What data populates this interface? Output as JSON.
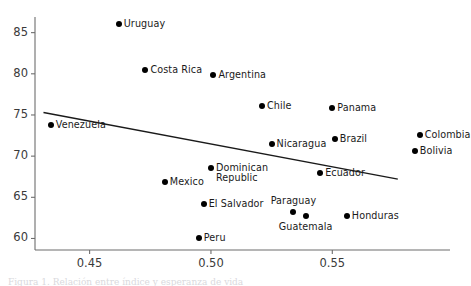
{
  "chart_data": {
    "type": "scatter",
    "title": "",
    "xlabel": "",
    "ylabel": "",
    "xlim": [
      0.4275,
      0.5985
    ],
    "ylim": [
      58.6,
      86.9
    ],
    "grid": false,
    "legend": false,
    "xticks": [
      0.45,
      0.5,
      0.55
    ],
    "xtick_labels": [
      "0.45",
      "0.50",
      "0.55"
    ],
    "yticks": [
      60,
      65,
      70,
      75,
      80,
      85
    ],
    "ytick_labels": [
      "60",
      "65",
      "70",
      "75",
      "80",
      "85"
    ],
    "points": [
      {
        "label": "Uruguay",
        "x": 0.462,
        "y": 86.0,
        "label_pos": "right"
      },
      {
        "label": "Costa Rica",
        "x": 0.473,
        "y": 80.5,
        "label_pos": "right"
      },
      {
        "label": "Argentina",
        "x": 0.501,
        "y": 79.8,
        "label_pos": "right"
      },
      {
        "label": "Chile",
        "x": 0.521,
        "y": 76.1,
        "label_pos": "right"
      },
      {
        "label": "Panama",
        "x": 0.55,
        "y": 75.9,
        "label_pos": "right"
      },
      {
        "label": "Venezuela",
        "x": 0.434,
        "y": 73.8,
        "label_pos": "right"
      },
      {
        "label": "Colombia",
        "x": 0.586,
        "y": 72.6,
        "label_pos": "right"
      },
      {
        "label": "Brazil",
        "x": 0.551,
        "y": 72.1,
        "label_pos": "right"
      },
      {
        "label": "Nicaragua",
        "x": 0.525,
        "y": 71.5,
        "label_pos": "right"
      },
      {
        "label": "Bolivia",
        "x": 0.584,
        "y": 70.6,
        "label_pos": "right"
      },
      {
        "label": "Dominican\nRepublic",
        "x": 0.5,
        "y": 68.6,
        "label_pos": "right"
      },
      {
        "label": "Ecuador",
        "x": 0.545,
        "y": 67.9,
        "label_pos": "right"
      },
      {
        "label": "Mexico",
        "x": 0.481,
        "y": 66.8,
        "label_pos": "right"
      },
      {
        "label": "El Salvador",
        "x": 0.497,
        "y": 64.2,
        "label_pos": "right"
      },
      {
        "label": "Paraguay",
        "x": 0.534,
        "y": 63.2,
        "label_pos": "above"
      },
      {
        "label": "Guatemala",
        "x": 0.539,
        "y": 62.7,
        "label_pos": "below"
      },
      {
        "label": "Honduras",
        "x": 0.556,
        "y": 62.7,
        "label_pos": "right"
      },
      {
        "label": "Peru",
        "x": 0.495,
        "y": 60.0,
        "label_pos": "right"
      }
    ],
    "trend_line": {
      "x_start": 0.431,
      "y_start": 75.3,
      "x_end": 0.577,
      "y_end": 67.2,
      "color": "#1a1a1a"
    }
  },
  "axes": {
    "spine_color": "#6d6d6d",
    "tick_color": "#6d6d6d",
    "label_color": "#3a3a3a"
  },
  "caption": {
    "text": "Figura 1. Relación entre índice y esperanza de vida"
  }
}
